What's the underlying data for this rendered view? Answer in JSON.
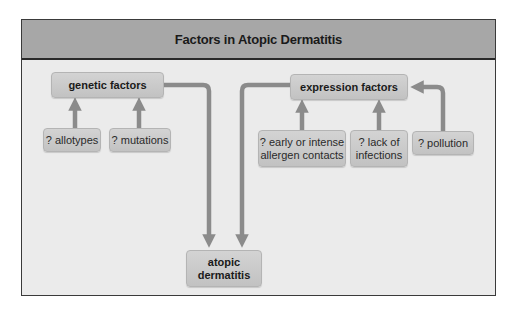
{
  "title": "Factors in Atopic Dermatitis",
  "colors": {
    "header_bg": "#a7a7a7",
    "body_bg": "#ebebeb",
    "box_bg": "#c9c9c9",
    "arrow": "#8b8b8b",
    "border": "#3a3a3a"
  },
  "nodes": {
    "genetic": {
      "label": "genetic factors"
    },
    "allotypes": {
      "label": "? allotypes"
    },
    "mutations": {
      "label": "? mutations"
    },
    "expression": {
      "label": "expression factors"
    },
    "allergen": {
      "line1": "? early or intense",
      "line2": "allergen contacts"
    },
    "infections": {
      "line1": "? lack of",
      "line2": "infections"
    },
    "pollution": {
      "label": "? pollution"
    },
    "atopic": {
      "line1": "atopic",
      "line2": "dermatitis"
    }
  },
  "edges": [
    {
      "from": "allotypes",
      "to": "genetic"
    },
    {
      "from": "mutations",
      "to": "genetic"
    },
    {
      "from": "allergen",
      "to": "expression"
    },
    {
      "from": "infections",
      "to": "expression"
    },
    {
      "from": "pollution",
      "to": "expression"
    },
    {
      "from": "genetic",
      "to": "atopic"
    },
    {
      "from": "expression",
      "to": "atopic"
    }
  ]
}
